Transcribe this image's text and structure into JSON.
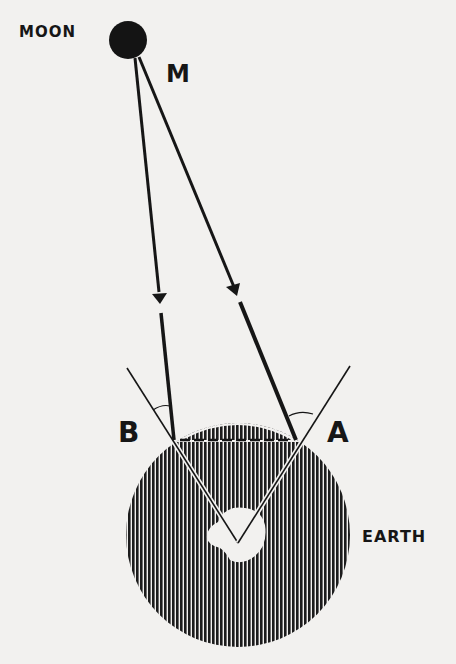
{
  "diagram": {
    "labels": {
      "moon": "MOON",
      "moon_point": "M",
      "point_b": "B",
      "point_a": "A",
      "earth": "EARTH"
    },
    "colors": {
      "ink": "#161616",
      "paper": "#f2f1ef",
      "earth_hatch": "#1c1c1c"
    }
  }
}
